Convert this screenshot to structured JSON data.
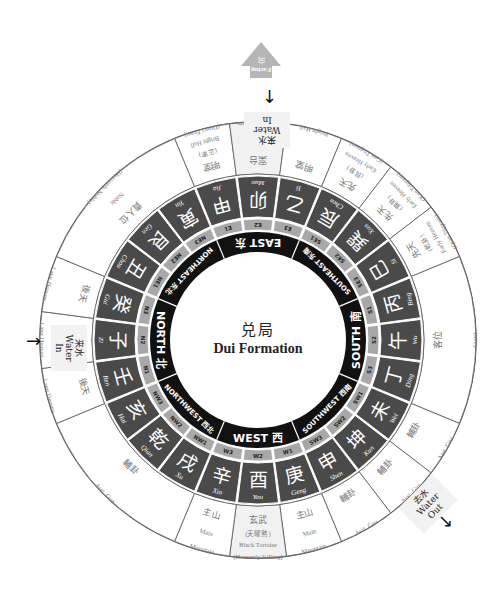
{
  "title": {
    "zh": "兑局",
    "en": "Dui Formation"
  },
  "colors": {
    "mountain_fill": "#4a4a4a",
    "mountain_text": "#ffffff",
    "sub_fill": "#a8a8a8",
    "sub_text": "#222222",
    "direction_fill": "#111111",
    "direction_text": "#ffffff",
    "outer_text": "#777777",
    "line": "#555555",
    "facing_arrow": "#b5b5b5",
    "sitting_block": "#b5b5b5"
  },
  "facing": {
    "zh": "向",
    "en": "Facing"
  },
  "water_markers": [
    {
      "id": "water-in-top",
      "zh": "来水",
      "en": "Water In"
    },
    {
      "id": "water-in-left",
      "zh": "来水",
      "en": "Water In"
    },
    {
      "id": "water-out",
      "zh": "去水",
      "en": "Water Out"
    }
  ],
  "directions": [
    {
      "en": "EAST",
      "zh": "东",
      "major": true
    },
    {
      "en": "SOUTHEAST",
      "zh": "东南",
      "major": false
    },
    {
      "en": "SOUTH",
      "zh": "南",
      "major": true
    },
    {
      "en": "SOUTHWEST",
      "zh": "西南",
      "major": false
    },
    {
      "en": "WEST",
      "zh": "西",
      "major": true
    },
    {
      "en": "NORTHWEST",
      "zh": "西北",
      "major": false
    },
    {
      "en": "NORTH",
      "zh": "北",
      "major": true
    },
    {
      "en": "NORTHEAST",
      "zh": "东北",
      "major": false
    }
  ],
  "mountains": [
    {
      "zh": "甲",
      "py": "Jia",
      "sub": "E1"
    },
    {
      "zh": "卯",
      "py": "Mao",
      "sub": "E2"
    },
    {
      "zh": "乙",
      "py": "Yi",
      "sub": "E3"
    },
    {
      "zh": "辰",
      "py": "Chen",
      "sub": "SE1"
    },
    {
      "zh": "巽",
      "py": "Xun",
      "sub": "SE2"
    },
    {
      "zh": "巳",
      "py": "Si",
      "sub": "SE3"
    },
    {
      "zh": "丙",
      "py": "Bing",
      "sub": "S1"
    },
    {
      "zh": "午",
      "py": "Wu",
      "sub": "S2"
    },
    {
      "zh": "丁",
      "py": "Ding",
      "sub": "S3"
    },
    {
      "zh": "未",
      "py": "Wei",
      "sub": "SW1"
    },
    {
      "zh": "坤",
      "py": "Kun",
      "sub": "SW2"
    },
    {
      "zh": "申",
      "py": "Shen",
      "sub": "SW3"
    },
    {
      "zh": "庚",
      "py": "Geng",
      "sub": "W1"
    },
    {
      "zh": "酉",
      "py": "You",
      "sub": "W2"
    },
    {
      "zh": "辛",
      "py": "Xin",
      "sub": "W3"
    },
    {
      "zh": "戌",
      "py": "Xu",
      "sub": "NW1"
    },
    {
      "zh": "乾",
      "py": "Qian",
      "sub": "NW2"
    },
    {
      "zh": "亥",
      "py": "Hai",
      "sub": "NW3"
    },
    {
      "zh": "壬",
      "py": "Ren",
      "sub": "N1"
    },
    {
      "zh": "子",
      "py": "Zi",
      "sub": "N2"
    },
    {
      "zh": "癸",
      "py": "Gui",
      "sub": "N3"
    },
    {
      "zh": "丑",
      "py": "Chou",
      "sub": "NE1"
    },
    {
      "zh": "艮",
      "py": "Gen",
      "sub": "NE2"
    },
    {
      "zh": "寅",
      "py": "Yin",
      "sub": "NE3"
    }
  ],
  "outer_sectors": [
    {
      "start": 0,
      "span": 1,
      "lines": [
        "明堂",
        "(正案)",
        "Bright Hall",
        "(Direct Front)"
      ]
    },
    {
      "start": 1,
      "span": 1,
      "lines": [
        "案台",
        "Table Mountain"
      ]
    },
    {
      "start": 2,
      "span": 1,
      "lines": [
        "明堂",
        "Bright Hall"
      ]
    },
    {
      "start": 3,
      "span": 1,
      "lines": [
        "先天",
        "(艮卦)",
        "Early Heaven",
        "(Gen Trigram)"
      ]
    },
    {
      "start": 4,
      "span": 1,
      "lines": [
        "先天",
        "(巽卦)",
        "Early Heaven",
        "(Xun Trigram)"
      ]
    },
    {
      "start": 5,
      "span": 1,
      "lines": [
        "先天",
        "(乾卦)",
        "Early Heaven",
        "(Qian Trigram)"
      ]
    },
    {
      "start": 6,
      "span": 3,
      "lines": [
        "客位",
        "Guest"
      ]
    },
    {
      "start": 9,
      "span": 1,
      "lines": [
        "輔卦",
        "Asst. Gua"
      ]
    },
    {
      "start": 10,
      "span": 1,
      "lines": [
        "輔卦",
        "Asst. Gua"
      ]
    },
    {
      "start": 11,
      "span": 1,
      "lines": [
        "輔卦",
        "Asst. Gua"
      ]
    },
    {
      "start": 12,
      "span": 1,
      "lines": [
        "主山",
        "Main",
        "Mountain"
      ]
    },
    {
      "start": 13,
      "span": 1,
      "lines": [
        "玄武",
        "(天曜煞)",
        "Black Tortoise",
        "(Heavenly Killing)"
      ]
    },
    {
      "start": 14,
      "span": 1,
      "lines": [
        "主山",
        "Main",
        "Mountain"
      ]
    },
    {
      "start": 15,
      "span": 3,
      "lines": [
        "輔卦",
        "Asst. Gua"
      ]
    },
    {
      "start": 18,
      "span": 1,
      "lines": [
        "後天",
        "Later Heaven"
      ]
    },
    {
      "start": 19,
      "span": 1,
      "lines": [
        "後天",
        "Later Heaven"
      ]
    },
    {
      "start": 20,
      "span": 1,
      "lines": [
        "後天",
        "Later Heaven"
      ]
    },
    {
      "start": 21,
      "span": 3,
      "lines": [
        "貴人位",
        "Noble",
        "(Heavenly Noble)"
      ]
    }
  ]
}
